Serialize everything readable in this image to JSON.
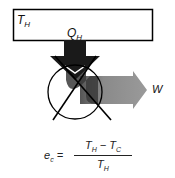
{
  "diagram": {
    "reservoir": {
      "label": "T",
      "subscript": "H"
    },
    "heat_in": {
      "label": "Q",
      "subscript": "H"
    },
    "work_out": {
      "label": "W"
    },
    "equation": {
      "lhs": "e",
      "lhs_sub": "c",
      "equals": " =",
      "num_a": "T",
      "num_a_sub": "H",
      "minus": " − ",
      "num_b": "T",
      "num_b_sub": "C",
      "den": "T",
      "den_sub": "H"
    },
    "colors": {
      "heat_arrow": "#1a1a1a",
      "work_arrow": "#8c8c8c",
      "outline": "#000000"
    }
  }
}
